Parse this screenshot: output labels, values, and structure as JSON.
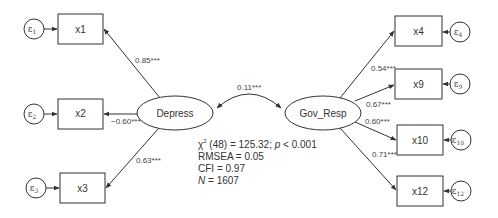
{
  "diagram": {
    "type": "structural-equation-model",
    "latents": [
      {
        "id": "depress",
        "label": "Depress"
      },
      {
        "id": "gov_resp",
        "label": "Gov_Resp"
      }
    ],
    "covariance": {
      "from": "Depress",
      "to": "Gov_Resp",
      "label": "0.11***"
    },
    "indicators": [
      {
        "id": "x1",
        "label": "x1",
        "latent": "Depress",
        "loading": "0.85***",
        "error": "ε",
        "error_sub": "1"
      },
      {
        "id": "x2",
        "label": "x2",
        "latent": "Depress",
        "loading": "−0.60***",
        "error": "ε",
        "error_sub": "2"
      },
      {
        "id": "x3",
        "label": "x3",
        "latent": "Depress",
        "loading": "0.63***",
        "error": "ε",
        "error_sub": "3"
      },
      {
        "id": "x4",
        "label": "x4",
        "latent": "Gov_Resp",
        "loading": "0.54***",
        "error": "ε",
        "error_sub": "4"
      },
      {
        "id": "x9",
        "label": "x9",
        "latent": "Gov_Resp",
        "loading": "0.67***",
        "error": "ε",
        "error_sub": "9"
      },
      {
        "id": "x10",
        "label": "x10",
        "latent": "Gov_Resp",
        "loading": "0.60***",
        "error": "ε",
        "error_sub": "10"
      },
      {
        "id": "x12",
        "label": "x12",
        "latent": "Gov_Resp",
        "loading": "0.71***",
        "error": "ε",
        "error_sub": "12"
      }
    ],
    "fit": {
      "chi_symbol": "χ",
      "chi_sup": "2",
      "chi_rest": " (48) = 125.32; ",
      "p_symbol": "p",
      "p_rest": " < 0.001",
      "rmsea": "RMSEA = 0.05",
      "cfi": "CFI = 0.97",
      "n_symbol": "N",
      "n_rest": " = 1607"
    }
  }
}
